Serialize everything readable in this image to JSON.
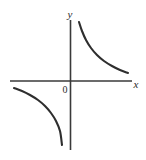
{
  "figure": {
    "background_color": "#ffffff",
    "width": 146,
    "height": 160
  },
  "labels": {
    "y_axis": "y",
    "x_axis": "x",
    "origin": "0"
  },
  "colors": {
    "axis": "#3a3a3a",
    "curve": "#2e2e2e",
    "text": "#2b2b2b",
    "background": "#ffffff"
  },
  "chart_data": {
    "type": "line",
    "title": "",
    "xlabel": "x",
    "ylabel": "y",
    "grid": false,
    "legend": false,
    "axes": {
      "origin_px": [
        70.5,
        81
      ],
      "x_axis_extent_px": [
        10,
        132
      ],
      "y_axis_extent_px": [
        20,
        150
      ],
      "origin_label": "0"
    },
    "series": [
      {
        "name": "branch-quadrant-I",
        "equation": "y = k/x, x > 0",
        "quadrant": 1,
        "points_px": [
          [
            79,
            22
          ],
          [
            82,
            31
          ],
          [
            86,
            40
          ],
          [
            91,
            48
          ],
          [
            97,
            55
          ],
          [
            104,
            61
          ],
          [
            112,
            66
          ],
          [
            120,
            70
          ],
          [
            128,
            73
          ]
        ]
      },
      {
        "name": "branch-quadrant-III",
        "equation": "y = k/x, x < 0",
        "quadrant": 3,
        "points_px": [
          [
            14,
            88
          ],
          [
            22,
            91
          ],
          [
            30,
            95
          ],
          [
            38,
            100
          ],
          [
            45,
            106
          ],
          [
            51,
            113
          ],
          [
            56,
            121
          ],
          [
            60,
            131
          ],
          [
            62,
            145
          ]
        ]
      }
    ],
    "asymptotes": [
      {
        "name": "vertical-asymptote",
        "equation": "x = 0"
      },
      {
        "name": "horizontal-asymptote",
        "equation": "y = 0"
      }
    ]
  }
}
